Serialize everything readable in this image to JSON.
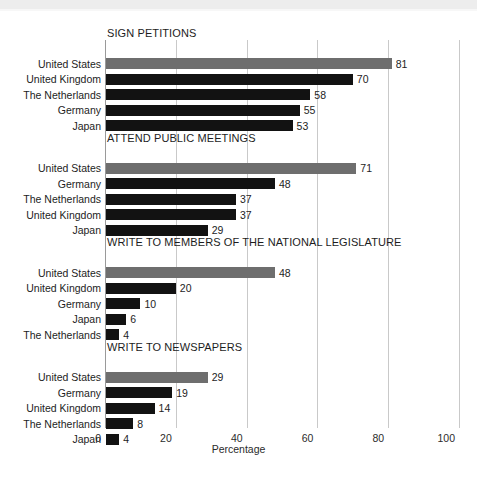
{
  "chart_data": {
    "type": "bar",
    "title": "",
    "xlabel": "Percentage",
    "ylabel": "",
    "xlim": [
      0,
      100
    ],
    "xticks": [
      0,
      20,
      40,
      60,
      80,
      100
    ],
    "xtick_labels": [
      "0",
      "20",
      "40",
      "60",
      "80",
      "100"
    ],
    "grid": true,
    "orientation": "horizontal",
    "legend": "none",
    "highlight_color": "#6e6e6e",
    "bar_color": "#121212",
    "groups": [
      {
        "title": "SIGN PETITIONS",
        "categories": [
          "United States",
          "United Kingdom",
          "The Netherlands",
          "Germany",
          "Japan"
        ],
        "values": [
          81,
          70,
          58,
          55,
          53
        ],
        "highlighted": [
          "United States"
        ]
      },
      {
        "title": "ATTEND PUBLIC MEETINGS",
        "categories": [
          "United States",
          "Germany",
          "The Netherlands",
          "United Kingdom",
          "Japan"
        ],
        "values": [
          71,
          48,
          37,
          37,
          29
        ],
        "highlighted": [
          "United States"
        ]
      },
      {
        "title": "WRITE TO MEMBERS OF THE NATIONAL LEGISLATURE",
        "categories": [
          "United States",
          "United Kingdom",
          "Germany",
          "Japan",
          "The Netherlands"
        ],
        "values": [
          48,
          20,
          10,
          6,
          4
        ],
        "highlighted": [
          "United States"
        ]
      },
      {
        "title": "WRITE TO NEWSPAPERS",
        "categories": [
          "United States",
          "Germany",
          "United Kingdom",
          "The Netherlands",
          "Japan"
        ],
        "values": [
          29,
          19,
          14,
          8,
          4
        ],
        "highlighted": [
          "United States"
        ]
      }
    ]
  }
}
